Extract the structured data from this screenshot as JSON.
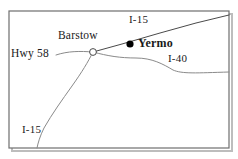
{
  "map": {
    "title": "Barstow-Yermo highway map",
    "background_color": "#ffffff",
    "frame": {
      "stroke_color": "#6e6e6e",
      "shadow_color": "#bdbdbd",
      "x": 9,
      "y": 11,
      "width": 220,
      "height": 137
    },
    "road_color": "#8a8a8a",
    "road_color_dark": "#4a4a4a",
    "labels": {
      "barstow": "Barstow",
      "hwy58": "Hwy 58",
      "i15_north": "I-15",
      "i15_south": "I-15",
      "i40": "I-40",
      "yermo": "Yermo"
    },
    "markers": {
      "yermo_city": {
        "name": "Yermo",
        "type": "filled-dot",
        "color": "#000000",
        "cx": 130,
        "cy": 44,
        "r": 3.6
      },
      "barstow_junction": {
        "name": "Barstow",
        "type": "open-circle",
        "stroke": "#4a4a4a",
        "fill": "#ffffff",
        "cx": 93,
        "cy": 52,
        "r": 3.4
      }
    },
    "roads": [
      {
        "name": "I-15 north",
        "path": "M 93 52 L 122 44 L 160 33 L 196 23 L 229 15"
      },
      {
        "name": "Hwy 58 west",
        "path": "M 56 55 C 68 51 80 51 93 52"
      },
      {
        "name": "I-15 south",
        "path": "M 93 52 C 88 62 82 72 72 86 C 62 100 52 114 44 128 C 40 136 38 143 37 148"
      },
      {
        "name": "I-40 east",
        "path": "M 93 52 C 108 56 120 58 136 58 C 152 58 163 64 173 70 C 182 74 196 73 229 72"
      }
    ]
  }
}
